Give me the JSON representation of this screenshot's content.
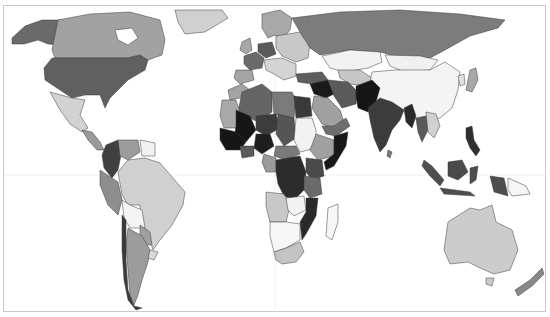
{
  "map": {
    "type": "choropleth",
    "projection": "world",
    "palette": {
      "level_0": "#ffffff",
      "level_1": "#d6d6d6",
      "level_2": "#a8a8a8",
      "level_3": "#7a7a7a",
      "level_4": "#555555",
      "level_5": "#333333",
      "level_6": "#151515"
    },
    "regions": [
      {
        "name": "Alaska",
        "level": 4
      },
      {
        "name": "Canada",
        "level": 2
      },
      {
        "name": "Greenland",
        "level": 1
      },
      {
        "name": "United States",
        "level": 4
      },
      {
        "name": "Mexico",
        "level": 1
      },
      {
        "name": "Central America",
        "level": 2
      },
      {
        "name": "Colombia",
        "level": 5
      },
      {
        "name": "Venezuela",
        "level": 2
      },
      {
        "name": "Guianas",
        "level": 0
      },
      {
        "name": "Ecuador",
        "level": 2
      },
      {
        "name": "Peru",
        "level": 2
      },
      {
        "name": "Brazil",
        "level": 1
      },
      {
        "name": "Bolivia",
        "level": 0
      },
      {
        "name": "Paraguay",
        "level": 2
      },
      {
        "name": "Argentina",
        "level": 2
      },
      {
        "name": "Chile",
        "level": 5
      },
      {
        "name": "Uruguay",
        "level": 1
      },
      {
        "name": "Western Europe",
        "level": 4
      },
      {
        "name": "Spain",
        "level": 2
      },
      {
        "name": "Scandinavia",
        "level": 2
      },
      {
        "name": "Eastern Europe",
        "level": 1
      },
      {
        "name": "Russia",
        "level": 3
      },
      {
        "name": "Kazakhstan",
        "level": 0
      },
      {
        "name": "Mongolia",
        "level": 0
      },
      {
        "name": "China",
        "level": 0
      },
      {
        "name": "Japan",
        "level": 2
      },
      {
        "name": "Turkey",
        "level": 4
      },
      {
        "name": "Iraq",
        "level": 6
      },
      {
        "name": "Iran",
        "level": 4
      },
      {
        "name": "Saudi Arabia",
        "level": 2
      },
      {
        "name": "Yemen",
        "level": 4
      },
      {
        "name": "Afghanistan/Pakistan",
        "level": 6
      },
      {
        "name": "India",
        "level": 5
      },
      {
        "name": "Bangladesh/Myanmar",
        "level": 5
      },
      {
        "name": "Thailand",
        "level": 4
      },
      {
        "name": "Vietnam",
        "level": 1
      },
      {
        "name": "Philippines",
        "level": 5
      },
      {
        "name": "Indonesia",
        "level": 4
      },
      {
        "name": "Papua New Guinea",
        "level": 0
      },
      {
        "name": "Australia",
        "level": 1
      },
      {
        "name": "New Zealand",
        "level": 3
      },
      {
        "name": "Morocco",
        "level": 2
      },
      {
        "name": "Algeria",
        "level": 4
      },
      {
        "name": "Libya",
        "level": 3
      },
      {
        "name": "Egypt",
        "level": 5
      },
      {
        "name": "Mauritania",
        "level": 2
      },
      {
        "name": "Mali",
        "level": 6
      },
      {
        "name": "Niger",
        "level": 5
      },
      {
        "name": "Chad",
        "level": 4
      },
      {
        "name": "Sudan",
        "level": 0
      },
      {
        "name": "Nigeria",
        "level": 6
      },
      {
        "name": "West Africa coast",
        "level": 6
      },
      {
        "name": "Ethiopia",
        "level": 2
      },
      {
        "name": "Somalia",
        "level": 6
      },
      {
        "name": "Central African Rep.",
        "level": 3
      },
      {
        "name": "DR Congo",
        "level": 5
      },
      {
        "name": "Kenya/Tanzania",
        "level": 4
      },
      {
        "name": "Angola",
        "level": 1
      },
      {
        "name": "Zambia",
        "level": 0
      },
      {
        "name": "Mozambique",
        "level": 5
      },
      {
        "name": "Namibia/Botswana",
        "level": 0
      },
      {
        "name": "South Africa",
        "level": 1
      },
      {
        "name": "Madagascar",
        "level": 0
      }
    ]
  }
}
